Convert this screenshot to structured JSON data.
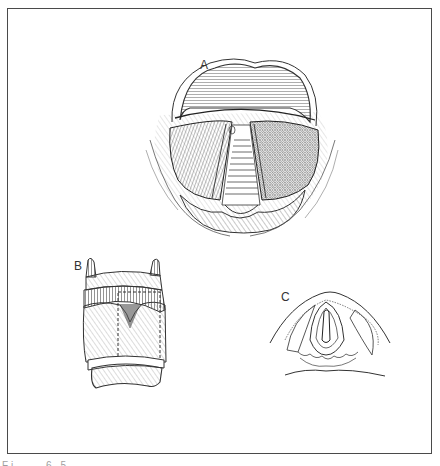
{
  "figure": {
    "panels": [
      {
        "label": "A",
        "description": "superior view of larynx / vocal folds"
      },
      {
        "label": "B",
        "description": "anterior view of larynx cartilages"
      },
      {
        "label": "C",
        "description": "cross-section of larynx"
      }
    ],
    "caption_partial": "Fi    6 5"
  }
}
